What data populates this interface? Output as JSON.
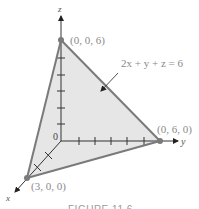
{
  "figure": {
    "equation": "2x + y + z = 6",
    "origin_label": "0",
    "axes": {
      "x": "x",
      "y": "y",
      "z": "z"
    },
    "points": {
      "z_intercept": "(0, 0, 6)",
      "y_intercept": "(0, 6, 0)",
      "x_intercept": "(3, 0, 0)"
    },
    "caption": "FIGURE 11.6",
    "colors": {
      "plane_fill": "#e6e6e6",
      "plane_edge": "#7a7a7a",
      "axis": "#333333",
      "label": "#8a8a8a"
    }
  }
}
